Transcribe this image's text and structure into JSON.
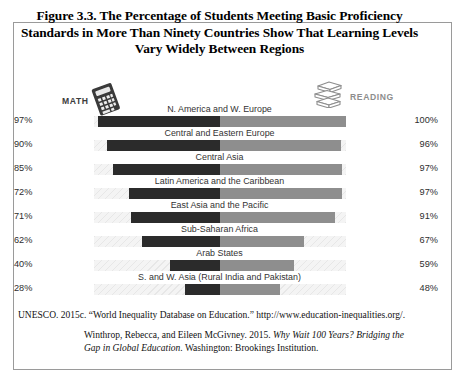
{
  "figure": {
    "title": "Figure 3.3. The Percentage of Students Meeting Basic Proficiency Standards in More Than Ninety Countries Show That Learning Levels Vary Widely Between Regions"
  },
  "legend": {
    "math_label": "MATH",
    "reading_label": "READING",
    "math_icon": "calculator-icon",
    "reading_icon": "books-icon",
    "math_color": "#2b2b2b",
    "reading_color": "#8e8e8e"
  },
  "citations": {
    "source": "UNESCO. 2015c. “World Inequality Database on Education.” http://www.education-inequalities.org/.",
    "reference_part1": "Winthrop, Rebecca, and Eileen McGivney. 2015. ",
    "reference_italic": "Why Wait 100 Years? Bridging the Gap in Global Education",
    "reference_part2": ". Washington: Brookings Institution."
  },
  "chart_data": {
    "type": "bar",
    "title": "Figure 3.3. The Percentage of Students Meeting Basic Proficiency Standards in More Than Ninety Countries Show That Learning Levels Vary Widely Between Regions",
    "subtitle": "",
    "xlabel": "",
    "ylabel": "",
    "orientation": "horizontal-diverging",
    "grid": false,
    "legend_position": "top",
    "xlim": [
      0,
      100
    ],
    "unit": "%",
    "categories": [
      "N. America and W. Europe",
      "Central and Eastern Europe",
      "Central Asia",
      "Latin America and the Caribbean",
      "East Asia and the Pacific",
      "Sub-Saharan Africa",
      "Arab States",
      "S. and W. Asia (Rural India and Pakistan)"
    ],
    "series": [
      {
        "name": "MATH",
        "direction": "left",
        "color": "#2b2b2b",
        "values": [
          97,
          90,
          85,
          72,
          71,
          62,
          40,
          28
        ],
        "labels": [
          "97%",
          "90%",
          "85%",
          "72%",
          "71%",
          "62%",
          "40%",
          "28%"
        ]
      },
      {
        "name": "READING",
        "direction": "right",
        "color": "#8e8e8e",
        "values": [
          100,
          96,
          97,
          97,
          91,
          67,
          59,
          48
        ],
        "labels": [
          "100%",
          "96%",
          "97%",
          "97%",
          "91%",
          "67%",
          "59%",
          "48%"
        ]
      }
    ]
  }
}
